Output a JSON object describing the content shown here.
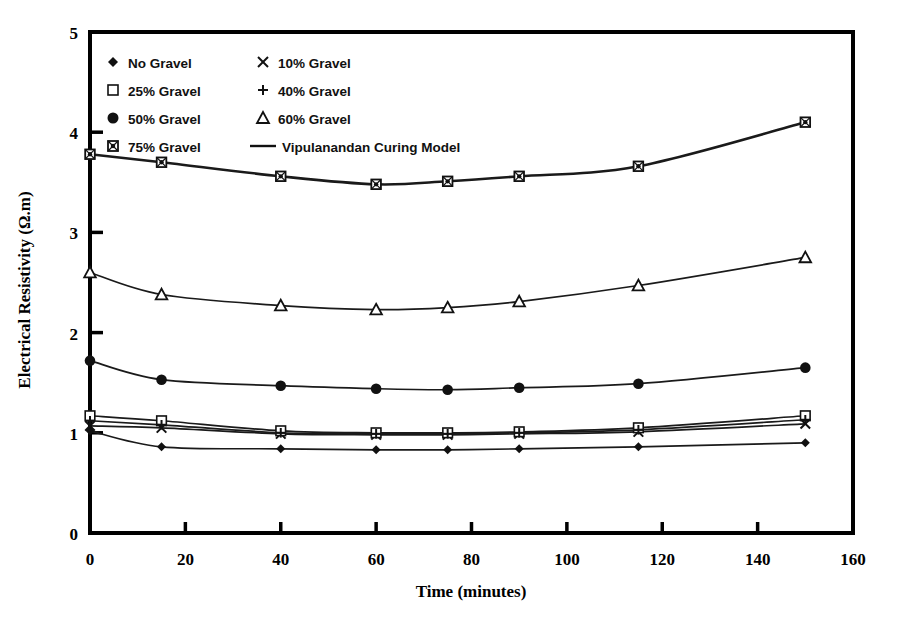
{
  "chart_data": {
    "type": "line",
    "title": "",
    "xlabel": "Time (minutes)",
    "ylabel": "Electrical Resistivity (Ω.m)",
    "xlim": [
      0,
      160
    ],
    "ylim": [
      0,
      5
    ],
    "xticks": [
      0,
      20,
      40,
      60,
      80,
      100,
      120,
      140,
      160
    ],
    "yticks": [
      0,
      1,
      2,
      3,
      4,
      5
    ],
    "xticklabels": [
      "0",
      "20",
      "40",
      "60",
      "80",
      "100",
      "120",
      "140",
      "160"
    ],
    "yticklabels": [
      "0",
      "1",
      "2",
      "3",
      "4",
      "5"
    ],
    "grid": false,
    "legend_position": "upper-left-inside",
    "x": [
      0,
      15,
      40,
      60,
      75,
      90,
      115,
      150
    ],
    "series": [
      {
        "name": "No Gravel",
        "marker": "filled-diamond",
        "values": [
          1.02,
          0.86,
          0.84,
          0.83,
          0.83,
          0.84,
          0.86,
          0.9
        ]
      },
      {
        "name": "10% Gravel",
        "marker": "cross-x",
        "values": [
          1.07,
          1.05,
          0.99,
          0.98,
          0.98,
          0.99,
          1.01,
          1.09
        ]
      },
      {
        "name": "25% Gravel",
        "marker": "open-square",
        "values": [
          1.17,
          1.12,
          1.02,
          1.0,
          1.0,
          1.01,
          1.05,
          1.17
        ]
      },
      {
        "name": "40% Gravel",
        "marker": "plus",
        "values": [
          1.12,
          1.08,
          1.0,
          0.99,
          0.99,
          1.0,
          1.03,
          1.13
        ]
      },
      {
        "name": "50% Gravel",
        "marker": "filled-circle",
        "values": [
          1.72,
          1.53,
          1.47,
          1.44,
          1.43,
          1.45,
          1.49,
          1.65
        ]
      },
      {
        "name": "60% Gravel",
        "marker": "open-triangle",
        "values": [
          2.6,
          2.38,
          2.27,
          2.23,
          2.25,
          2.31,
          2.47,
          2.75
        ]
      },
      {
        "name": "75% Gravel",
        "marker": "boxed-square",
        "values": [
          3.78,
          3.7,
          3.56,
          3.48,
          3.51,
          3.56,
          3.66,
          4.1
        ]
      }
    ],
    "model_curve": {
      "name": "Vipulanandan Curing Model",
      "style": "solid-line"
    },
    "legend_entries": [
      {
        "label": "No Gravel",
        "marker": "filled-diamond"
      },
      {
        "label": "10% Gravel",
        "marker": "cross-x"
      },
      {
        "label": "25% Gravel",
        "marker": "open-square"
      },
      {
        "label": "40% Gravel",
        "marker": "plus"
      },
      {
        "label": "50% Gravel",
        "marker": "filled-circle"
      },
      {
        "label": "60% Gravel",
        "marker": "open-triangle"
      },
      {
        "label": "75% Gravel",
        "marker": "boxed-square"
      },
      {
        "label": "Vipulanandan Curing Model",
        "marker": "line"
      }
    ],
    "colors": {
      "line": "#1a1a1a",
      "marker": "#111111",
      "axis": "#000000",
      "background": "#ffffff"
    }
  }
}
